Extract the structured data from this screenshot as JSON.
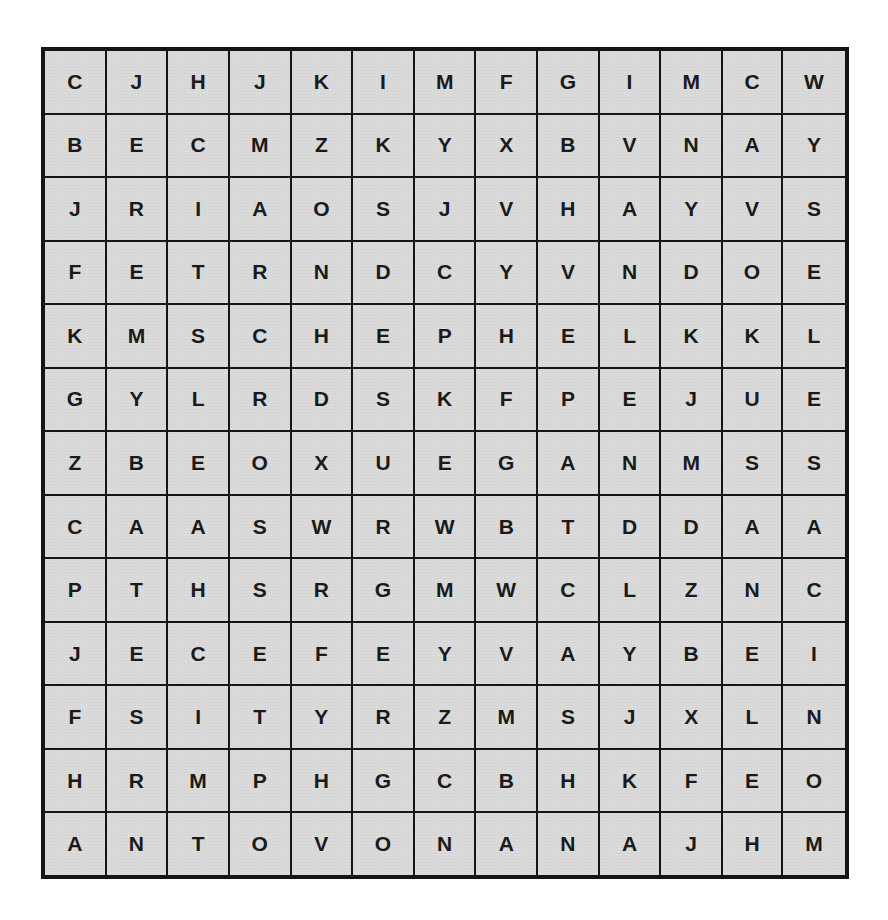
{
  "puzzle": {
    "type": "word-search",
    "rows": 13,
    "cols": 13,
    "colors": {
      "cell_bg": "#dadada",
      "grid_line": "#151515",
      "letter": "#1a1a1a",
      "page_bg": "#ffffff"
    },
    "grid": [
      [
        "C",
        "J",
        "H",
        "J",
        "K",
        "I",
        "M",
        "F",
        "G",
        "I",
        "M",
        "C",
        "W"
      ],
      [
        "B",
        "E",
        "C",
        "M",
        "Z",
        "K",
        "Y",
        "X",
        "B",
        "V",
        "N",
        "A",
        "Y"
      ],
      [
        "J",
        "R",
        "I",
        "A",
        "O",
        "S",
        "J",
        "V",
        "H",
        "A",
        "Y",
        "V",
        "S"
      ],
      [
        "F",
        "E",
        "T",
        "R",
        "N",
        "D",
        "C",
        "Y",
        "V",
        "N",
        "D",
        "O",
        "E"
      ],
      [
        "K",
        "M",
        "S",
        "C",
        "H",
        "E",
        "P",
        "H",
        "E",
        "L",
        "K",
        "K",
        "L"
      ],
      [
        "G",
        "Y",
        "L",
        "R",
        "D",
        "S",
        "K",
        "F",
        "P",
        "E",
        "J",
        "U",
        "E"
      ],
      [
        "Z",
        "B",
        "E",
        "O",
        "X",
        "U",
        "E",
        "G",
        "A",
        "N",
        "M",
        "S",
        "S"
      ],
      [
        "C",
        "A",
        "A",
        "S",
        "W",
        "R",
        "W",
        "B",
        "T",
        "D",
        "D",
        "A",
        "A"
      ],
      [
        "P",
        "T",
        "H",
        "S",
        "R",
        "G",
        "M",
        "W",
        "C",
        "L",
        "Z",
        "N",
        "C"
      ],
      [
        "J",
        "E",
        "C",
        "E",
        "F",
        "E",
        "Y",
        "V",
        "A",
        "Y",
        "B",
        "E",
        "I"
      ],
      [
        "F",
        "S",
        "I",
        "T",
        "Y",
        "R",
        "Z",
        "M",
        "S",
        "J",
        "X",
        "L",
        "N"
      ],
      [
        "H",
        "R",
        "M",
        "P",
        "H",
        "G",
        "C",
        "B",
        "H",
        "K",
        "F",
        "E",
        "O"
      ],
      [
        "A",
        "N",
        "T",
        "O",
        "V",
        "O",
        "N",
        "A",
        "N",
        "A",
        "J",
        "H",
        "M"
      ]
    ]
  }
}
